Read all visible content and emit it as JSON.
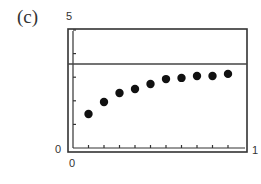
{
  "panel_label": "(c)",
  "axis_labels": {
    "y_max": "5",
    "y_min": "0",
    "x_min": "0",
    "x_max": "1"
  },
  "colors": {
    "frame": "#333333",
    "dots": "#111111",
    "asymptote": "#444444"
  },
  "chart_data": {
    "type": "scatter",
    "title": "(c)",
    "xlabel": "",
    "ylabel": "",
    "xlim": [
      0,
      1
    ],
    "ylim": [
      0,
      5
    ],
    "grid": false,
    "legend": null,
    "x_ticks_step": 0.1,
    "y_ticks_step": 1,
    "tick_labels": {
      "x": [
        "0",
        "1"
      ],
      "y": [
        "0",
        "5"
      ]
    },
    "series": [
      {
        "name": "points",
        "x": [
          0.1,
          0.2,
          0.3,
          0.4,
          0.5,
          0.6,
          0.7,
          0.8,
          0.9,
          1.0
        ],
        "y": [
          1.44,
          1.95,
          2.33,
          2.5,
          2.71,
          2.92,
          2.97,
          3.05,
          3.05,
          3.14
        ]
      }
    ],
    "annotations": [
      {
        "type": "horizontal_line",
        "y": 3.56,
        "description": "horizontal asymptote line"
      }
    ]
  }
}
